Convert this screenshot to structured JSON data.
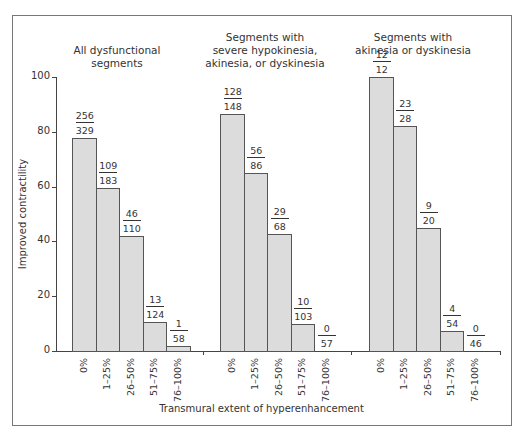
{
  "chart_data": {
    "type": "bar",
    "ylabel": "Improved contractility",
    "xlabel": "Transmural extent of hyperenhancement",
    "ylim": [
      0,
      100
    ],
    "yticks": [
      0,
      20,
      40,
      60,
      80,
      100
    ],
    "categories": [
      "0%",
      "1–25%",
      "26–50%",
      "51–75%",
      "76–100%"
    ],
    "grid": false,
    "groups": [
      {
        "title": [
          "All dysfunctional",
          "segments"
        ],
        "values": [
          77.8,
          59.6,
          41.8,
          10.5,
          1.7
        ],
        "fractions": [
          {
            "num": "256",
            "den": "329"
          },
          {
            "num": "109",
            "den": "183"
          },
          {
            "num": "46",
            "den": "110"
          },
          {
            "num": "13",
            "den": "124"
          },
          {
            "num": "1",
            "den": "58"
          }
        ]
      },
      {
        "title": [
          "Segments with",
          "severe hypokinesia,",
          "akinesia, or dyskinesia"
        ],
        "values": [
          86.5,
          65.1,
          42.6,
          9.7,
          0
        ],
        "fractions": [
          {
            "num": "128",
            "den": "148"
          },
          {
            "num": "56",
            "den": "86"
          },
          {
            "num": "29",
            "den": "68"
          },
          {
            "num": "10",
            "den": "103"
          },
          {
            "num": "0",
            "den": "57"
          }
        ]
      },
      {
        "title": [
          "Segments with",
          "akinesia or dyskinesia"
        ],
        "values": [
          100,
          82.1,
          45.0,
          7.4,
          0
        ],
        "fractions": [
          {
            "num": "12",
            "den": "12"
          },
          {
            "num": "23",
            "den": "28"
          },
          {
            "num": "9",
            "den": "20"
          },
          {
            "num": "4",
            "den": "54"
          },
          {
            "num": "0",
            "den": "46"
          }
        ]
      }
    ]
  }
}
